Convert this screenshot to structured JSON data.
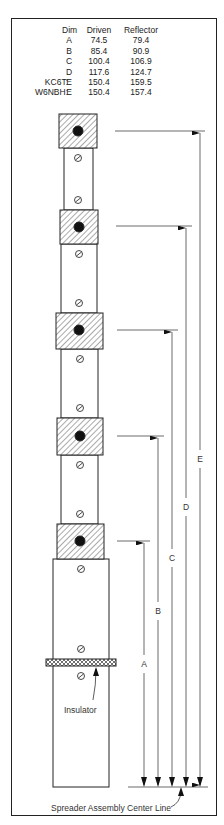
{
  "table": {
    "headers": {
      "dim": "Dim",
      "driven": "Driven",
      "reflector": "Reflector"
    },
    "rows": [
      {
        "callsign": "",
        "dim": "A",
        "driven": "74.5",
        "reflector": "79.4"
      },
      {
        "callsign": "",
        "dim": "B",
        "driven": "85.4",
        "reflector": "90.9"
      },
      {
        "callsign": "",
        "dim": "C",
        "driven": "100.4",
        "reflector": "106.9"
      },
      {
        "callsign": "",
        "dim": "D",
        "driven": "117.6",
        "reflector": "124.7"
      },
      {
        "callsign": "KC6T:",
        "dim": "E",
        "driven": "150.4",
        "reflector": "159.5"
      },
      {
        "callsign": "W6NBH:",
        "dim": "E",
        "driven": "150.4",
        "reflector": "157.4"
      }
    ]
  },
  "diagram": {
    "dimension_labels": {
      "A": "A",
      "B": "B",
      "C": "C",
      "D": "D",
      "E": "E"
    },
    "insulator_label": "Insulator",
    "centerline_label": "Spreader Assembly Center Line",
    "colors": {
      "line": "#222222",
      "hatch": "#555555",
      "fill": "#ffffff"
    }
  }
}
